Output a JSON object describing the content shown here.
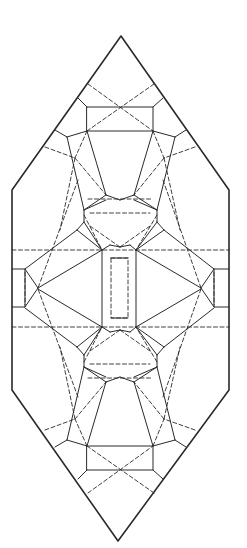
{
  "diagram": {
    "title": "",
    "kind": "origami crease pattern",
    "line_color": "#2a2a2a",
    "background": "#ffffff",
    "legend": {
      "solid": "fold line",
      "dashed": "fold line (alternate)"
    }
  }
}
